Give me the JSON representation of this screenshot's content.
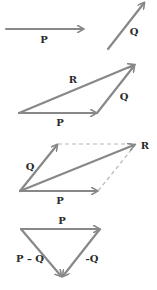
{
  "colors": {
    "vector": "#888888",
    "dashed": "#b5b5b5",
    "label": "#2a2a2a",
    "background": "#ffffff"
  },
  "figures": [
    {
      "name": "separate-vectors",
      "labels": {
        "p": "P",
        "q": "Q"
      }
    },
    {
      "name": "triangle-addition",
      "labels": {
        "p": "P",
        "q": "Q",
        "r": "R"
      }
    },
    {
      "name": "parallelogram-addition",
      "labels": {
        "p": "P",
        "q": "Q",
        "r": "R"
      }
    },
    {
      "name": "vector-subtraction",
      "labels": {
        "p": "P",
        "neg_q": "-Q",
        "p_minus_q": "P – Q"
      }
    }
  ]
}
